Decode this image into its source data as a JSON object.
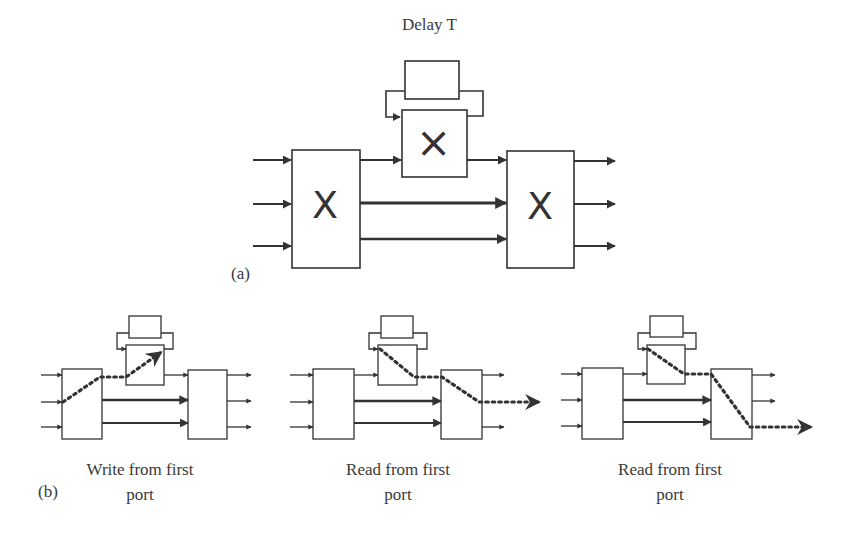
{
  "figure": {
    "part_a": {
      "label": "(a)",
      "delay_label": "Delay T",
      "left_switch_symbol": "X",
      "right_switch_symbol": "X",
      "delay_switch_symbol": "×"
    },
    "part_b": {
      "label": "(b)",
      "panels": [
        {
          "caption_line1": "Write from first",
          "caption_line2": "port"
        },
        {
          "caption_line1": "Read from first",
          "caption_line2": "port"
        },
        {
          "caption_line1": "Read from first",
          "caption_line2": "port"
        }
      ]
    }
  }
}
